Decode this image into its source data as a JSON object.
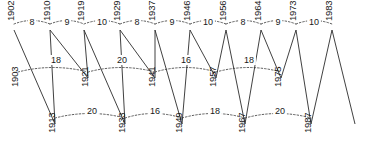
{
  "chart_data": {
    "type": "diagram",
    "title": "",
    "subtitle": "",
    "xlabel": "",
    "ylabel": "",
    "rows": [
      {
        "name": "top",
        "y": 30,
        "years": [
          1902,
          1910,
          1919,
          1929,
          1937,
          1946,
          1956,
          1964,
          1973,
          1983
        ],
        "x": [
          14,
          50,
          84,
          120,
          155,
          190,
          226,
          261,
          296,
          332
        ],
        "gaps": [
          8,
          9,
          10,
          8,
          9,
          10,
          8,
          9,
          10
        ],
        "gap_x": [
          32,
          67,
          102,
          137,
          172,
          208,
          243,
          278,
          314
        ],
        "gap_y": [
          24,
          24,
          24,
          24,
          24,
          24,
          24,
          24,
          24
        ]
      },
      {
        "name": "middle",
        "y": 78,
        "years": [
          1903,
          1921,
          1941,
          1957,
          1975
        ],
        "x": [
          18,
          88,
          155,
          216,
          281
        ],
        "gaps": [
          18,
          20,
          16,
          18
        ],
        "gap_x": [
          56,
          122,
          186,
          249
        ],
        "gap_y": [
          62,
          62,
          62,
          62
        ]
      },
      {
        "name": "bottom",
        "y": 124,
        "years": [
          1913,
          1933,
          1949,
          1967,
          1987
        ],
        "x": [
          55,
          125,
          182,
          245,
          311
        ],
        "gaps": [
          20,
          16,
          18,
          20
        ],
        "gap_x": [
          92,
          155,
          215,
          280
        ],
        "gap_y": [
          113,
          113,
          113,
          113
        ]
      }
    ],
    "solid_links": [
      [
        14,
        30,
        55,
        124
      ],
      [
        55,
        124,
        50,
        30
      ],
      [
        50,
        30,
        88,
        78
      ],
      [
        88,
        78,
        84,
        30
      ],
      [
        84,
        30,
        125,
        124
      ],
      [
        125,
        124,
        120,
        30
      ],
      [
        120,
        30,
        155,
        78
      ],
      [
        155,
        78,
        155,
        30
      ],
      [
        155,
        30,
        182,
        124
      ],
      [
        182,
        124,
        190,
        30
      ],
      [
        190,
        30,
        216,
        78
      ],
      [
        216,
        78,
        226,
        30
      ],
      [
        226,
        30,
        245,
        124
      ],
      [
        245,
        124,
        261,
        30
      ],
      [
        261,
        30,
        281,
        78
      ],
      [
        281,
        78,
        296,
        30
      ],
      [
        296,
        30,
        311,
        124
      ],
      [
        311,
        124,
        332,
        30
      ],
      [
        332,
        30,
        355,
        124
      ]
    ],
    "colors": {
      "background": "#ffffff",
      "stroke": "#2b2b2b",
      "dotted_stroke": "#333333",
      "text": "#1a1a1a"
    }
  }
}
